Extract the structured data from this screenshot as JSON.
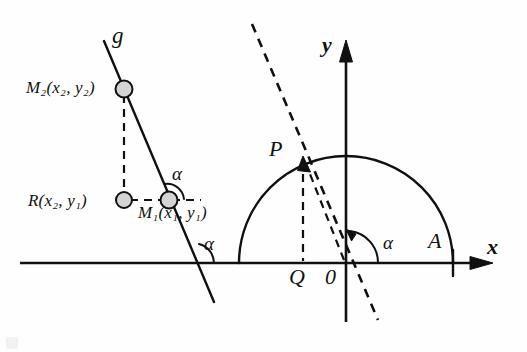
{
  "figure": {
    "type": "geometry-diagram",
    "background_color": "#fefefe",
    "ink_color": "#101010",
    "point_fill_color": "#d4d4d4"
  },
  "left_construction": {
    "line_label": "g",
    "points": [
      {
        "name": "M2",
        "label": "M",
        "sub": "2",
        "coords": "(x",
        "coord_sub1": "2",
        "coord_mid": ", y",
        "coord_sub2": "2",
        "coord_end": ")"
      },
      {
        "name": "R",
        "label": "R"
      },
      {
        "name": "M1",
        "label": "M",
        "sub": "1"
      }
    ],
    "label_m2": "M₂(x₂, y₂)",
    "label_r": "R(x₂, y₁)",
    "label_m1": "M₁(x₁, y₁)",
    "angle_upper": "α",
    "angle_lower": "α"
  },
  "right_construction": {
    "axis_x": "x",
    "axis_y": "y",
    "origin": "0",
    "point_p": "P",
    "point_q": "Q",
    "point_a": "A",
    "angle": "α"
  },
  "glyphs": {
    "M": "M",
    "R": "R",
    "sub_1": "1",
    "sub_2": "2",
    "paren_open": "(",
    "paren_close": ")",
    "comma": ",",
    "x": "x",
    "y": "y",
    "alpha": "α",
    "g": "g",
    "P": "P",
    "Q": "Q",
    "A": "A",
    "zero": "0"
  }
}
